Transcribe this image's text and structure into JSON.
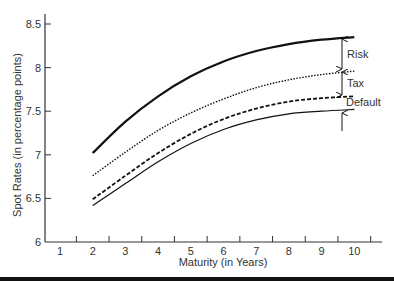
{
  "chart_data": {
    "type": "line",
    "title": "",
    "xlabel": "Maturity (in Years)",
    "ylabel": "Spot Rates (in percentage points)",
    "xlim": [
      0.5,
      10.9
    ],
    "ylim": [
      6,
      8.6
    ],
    "x_ticks": [
      1,
      2,
      3,
      4,
      5,
      6,
      7,
      8,
      9,
      10
    ],
    "y_ticks": [
      6,
      6.5,
      7,
      7.5,
      8,
      8.5
    ],
    "y_tick_labels": [
      "6",
      "6.5",
      "7",
      "7.5",
      "8",
      "8.5"
    ],
    "grid": false,
    "legend": "none",
    "x": [
      2,
      3,
      4,
      5,
      6,
      7,
      8,
      9,
      10
    ],
    "series": [
      {
        "name": "Risky corporate (top)",
        "style": "solid-thick",
        "values": [
          7.02,
          7.38,
          7.67,
          7.9,
          8.07,
          8.19,
          8.27,
          8.32,
          8.35
        ]
      },
      {
        "name": "Taxable (dotted)",
        "style": "dotted",
        "values": [
          6.76,
          7.03,
          7.28,
          7.48,
          7.64,
          7.77,
          7.86,
          7.92,
          7.96
        ]
      },
      {
        "name": "Default-free (dashed)",
        "style": "dashed",
        "values": [
          6.49,
          6.76,
          7.02,
          7.24,
          7.41,
          7.53,
          7.61,
          7.65,
          7.67
        ]
      },
      {
        "name": "Base (thin solid)",
        "style": "solid-thin",
        "values": [
          6.42,
          6.67,
          6.92,
          7.13,
          7.29,
          7.4,
          7.47,
          7.5,
          7.52
        ]
      }
    ],
    "annotations": [
      {
        "text": "Risk",
        "between": [
          "Risky corporate (top)",
          "Taxable (dotted)"
        ]
      },
      {
        "text": "Tax",
        "between": [
          "Taxable (dotted)",
          "Default-free (dashed)"
        ]
      },
      {
        "text": "Default",
        "between": [
          "Default-free (dashed)",
          "Base (thin solid)"
        ]
      }
    ]
  },
  "colors": {
    "line": "#111111",
    "axis": "#333333",
    "text": "#333333"
  }
}
